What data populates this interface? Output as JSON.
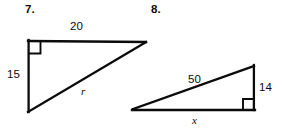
{
  "page": {
    "background_color": "#ffffff",
    "ink_color": "#0b0b0b",
    "width": 284,
    "height": 131
  },
  "problems": [
    {
      "number_label": "7.",
      "shape": "right-triangle",
      "right_angle_position": "top-left",
      "vertices": {
        "top_left": [
          28,
          41
        ],
        "top_right": [
          146,
          42
        ],
        "bottom_left": [
          28,
          112
        ]
      },
      "labels": {
        "top_side": "20",
        "left_side": "15",
        "hypotenuse": "r"
      }
    },
    {
      "number_label": "8.",
      "shape": "right-triangle",
      "right_angle_position": "bottom-right",
      "vertices": {
        "left": [
          133,
          109
        ],
        "top_right": [
          254,
          66
        ],
        "bottom_right": [
          254,
          110
        ]
      },
      "labels": {
        "hypotenuse": "50",
        "right_side": "14",
        "bottom_side": "x"
      }
    }
  ]
}
